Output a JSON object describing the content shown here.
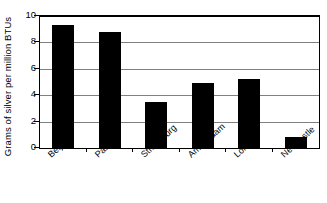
{
  "chart_data": {
    "type": "bar",
    "title": "",
    "xlabel": "",
    "ylabel": "Grams of silver per million BTUs",
    "categories": [
      "Beijing",
      "Paris",
      "Strasbourg",
      "Amsterdam",
      "London",
      "Newcastle"
    ],
    "values": [
      9.3,
      8.8,
      3.5,
      4.9,
      5.2,
      0.8
    ],
    "ylim": [
      0,
      10
    ],
    "yticks": [
      0,
      2,
      4,
      6,
      8,
      10
    ],
    "ytick_labels": [
      "0",
      "2",
      "4",
      "6",
      "8",
      "10"
    ],
    "grid": true,
    "grid_axis": "y",
    "legend": false,
    "bar_color": "#000000",
    "gridline_color": "#808080",
    "axis_color": "#000000",
    "background_color": "#FFFFFF",
    "xlabel_rotation": -42
  }
}
